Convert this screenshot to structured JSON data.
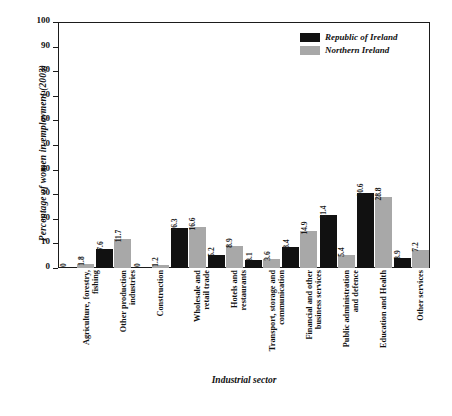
{
  "chart_data": {
    "type": "bar",
    "title": "",
    "xlabel": "Industrial sector",
    "ylabel": "Percentage of women in employment (2003)",
    "ylim": [
      0,
      100
    ],
    "ytick_step": 10,
    "yticks": [
      "100",
      "90",
      "80",
      "70",
      "60",
      "50",
      "40",
      "30",
      "20",
      "10",
      "0"
    ],
    "grid": false,
    "legend_position": "top-right",
    "categories": [
      "Agriculture, forestry,\nfishing",
      "Other production\nindustries",
      "Construction",
      "Wholesale and\nretail trade",
      "Hotels and\nrestaurants",
      "Transport, storage and\ncommunication",
      "Financial and other\nbusiness services",
      "Public administration\nand defence",
      "Education and Health",
      "Other services"
    ],
    "series": [
      {
        "name": "Republic of Ireland",
        "color": "#111111",
        "values": [
          0,
          7.6,
          0,
          16.3,
          5.2,
          3.1,
          8.4,
          21.4,
          30.6,
          3.9
        ],
        "labels": [
          "0",
          "7.6",
          "0",
          "16.3",
          "5.2",
          "3.1",
          "8.4",
          "21.4",
          "30.6",
          "3.9"
        ]
      },
      {
        "name": "Northern Ireland",
        "color": "#a8a8a8",
        "values": [
          1.8,
          11.7,
          1.2,
          16.6,
          8.9,
          3.6,
          14.9,
          5.4,
          28.8,
          7.2
        ],
        "labels": [
          "1.8",
          "11.7",
          "1.2",
          "16.6",
          "8.9",
          "3.6",
          "14.9",
          "5.4",
          "28.8",
          "7.2"
        ]
      }
    ]
  },
  "legend": {
    "items": [
      {
        "label": "Republic of Ireland"
      },
      {
        "label": "Northern Ireland"
      }
    ]
  },
  "axes": {
    "y_title": "Percentage of women in employment (2003)",
    "x_title": "Industrial sector"
  }
}
